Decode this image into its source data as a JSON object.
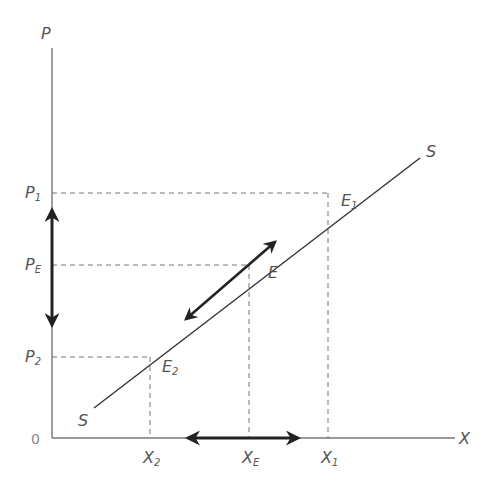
{
  "diagram": {
    "type": "supply-curve",
    "axes": {
      "y_label": "P",
      "x_label": "X",
      "origin_label": "0"
    },
    "curve": {
      "name": "S",
      "label_top": "S",
      "label_bottom": "S"
    },
    "price_levels": [
      {
        "label": "P",
        "sub": "1",
        "y": 193
      },
      {
        "label": "P",
        "sub": "E",
        "y": 265
      },
      {
        "label": "P",
        "sub": "2",
        "y": 357
      }
    ],
    "quantities": [
      {
        "label": "X",
        "sub": "2",
        "x": 150
      },
      {
        "label": "X",
        "sub": "E",
        "x": 249
      },
      {
        "label": "X",
        "sub": "1",
        "x": 328
      }
    ],
    "points": [
      {
        "label": "E",
        "sub": "1"
      },
      {
        "label": "E",
        "sub": ""
      },
      {
        "label": "E",
        "sub": "2"
      }
    ],
    "colors": {
      "axis": "#777777",
      "curve": "#333333",
      "dashed": "#777777",
      "arrow": "#222222",
      "text": "#555555"
    }
  }
}
